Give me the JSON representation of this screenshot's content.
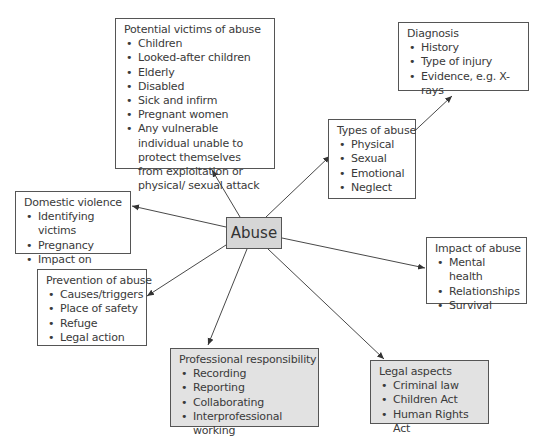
{
  "center": {
    "label": "Abuse"
  },
  "nodes": {
    "victims": {
      "title": "Potential victims of abuse",
      "items": [
        "Children",
        "Looked-after children",
        "Elderly",
        "Disabled",
        "Sick and infirm",
        "Pregnant women",
        "Any vulnerable individual unable to protect themselves from exploitation or physical/ sexual attack"
      ]
    },
    "diagnosis": {
      "title": "Diagnosis",
      "items": [
        "History",
        "Type of injury",
        "Evidence, e.g. X-rays"
      ]
    },
    "types": {
      "title": "Types of abuse",
      "items": [
        "Physical",
        "Sexual",
        "Emotional",
        "Neglect"
      ]
    },
    "domestic": {
      "title": "Domestic violence",
      "items": [
        "Identifying victims",
        "Pregnancy",
        "Impact on children"
      ]
    },
    "impact": {
      "title": "Impact of abuse",
      "items": [
        "Mental health",
        "Relationships",
        "Survival"
      ]
    },
    "prevention": {
      "title": "Prevention of abuse",
      "items": [
        "Causes/triggers",
        "Place of safety",
        "Refuge",
        "Legal action"
      ]
    },
    "professional": {
      "title": "Professional responsibility",
      "items": [
        "Recording",
        "Reporting",
        "Collaborating",
        "Interprofessional working"
      ]
    },
    "legal": {
      "title": "Legal aspects",
      "items": [
        "Criminal law",
        "Children Act",
        "Human Rights Act"
      ]
    }
  },
  "colors": {
    "line": "#333333",
    "grey_fill": "#e2e2e2",
    "center_fill": "#d6d6d6"
  }
}
